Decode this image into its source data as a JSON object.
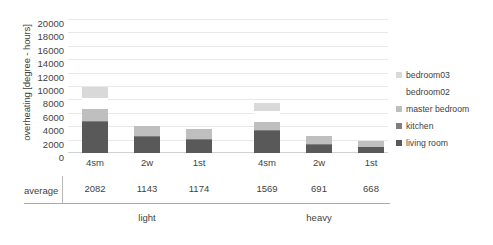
{
  "chart_data": {
    "type": "bar",
    "stacked": true,
    "title": "",
    "xlabel": "",
    "ylabel": "overheating [degree - hours]",
    "ylim": [
      0,
      20000
    ],
    "ytick_step": 2000,
    "yticks": [
      "20000",
      "18000",
      "16000",
      "14000",
      "12000",
      "10000",
      "8000",
      "6000",
      "4000",
      "2000",
      "0"
    ],
    "grid": true,
    "legend_position": "right",
    "groups": [
      {
        "name": "light",
        "categories": [
          "4sm",
          "2w",
          "1st"
        ]
      },
      {
        "name": "heavy",
        "categories": [
          "4sm",
          "2w",
          "1st"
        ]
      }
    ],
    "categories": [
      "4sm",
      "2w",
      "1st",
      "4sm",
      "2w",
      "1st"
    ],
    "series": [
      {
        "name": "living room",
        "color": "#595959",
        "values": [
          4600,
          2450,
          2000,
          3250,
          1250,
          850
        ]
      },
      {
        "name": "kitchen",
        "color": "#7f7f7f",
        "values": [
          200,
          150,
          150,
          150,
          100,
          100
        ]
      },
      {
        "name": "master bedroom",
        "color": "#bfbfbf",
        "values": [
          1700,
          1450,
          1400,
          1300,
          1200,
          900
        ]
      },
      {
        "name": "bedroom02",
        "color": "#ffffff",
        "values": [
          1700,
          0,
          0,
          1500,
          0,
          0
        ]
      },
      {
        "name": "bedroom03",
        "color": "#d9d9d9",
        "values": [
          1700,
          0,
          0,
          1200,
          0,
          0
        ]
      }
    ],
    "averages": [
      "2082",
      "1143",
      "1174",
      "1569",
      "691",
      "668"
    ],
    "average_row_label": "average",
    "legend": [
      {
        "label": "bedroom03",
        "color": "#d9d9d9"
      },
      {
        "label": "bedroom02",
        "color": "#ffffff"
      },
      {
        "label": "master bedroom",
        "color": "#bfbfbf"
      },
      {
        "label": "kitchen",
        "color": "#7f7f7f"
      },
      {
        "label": "living room",
        "color": "#595959"
      }
    ]
  }
}
